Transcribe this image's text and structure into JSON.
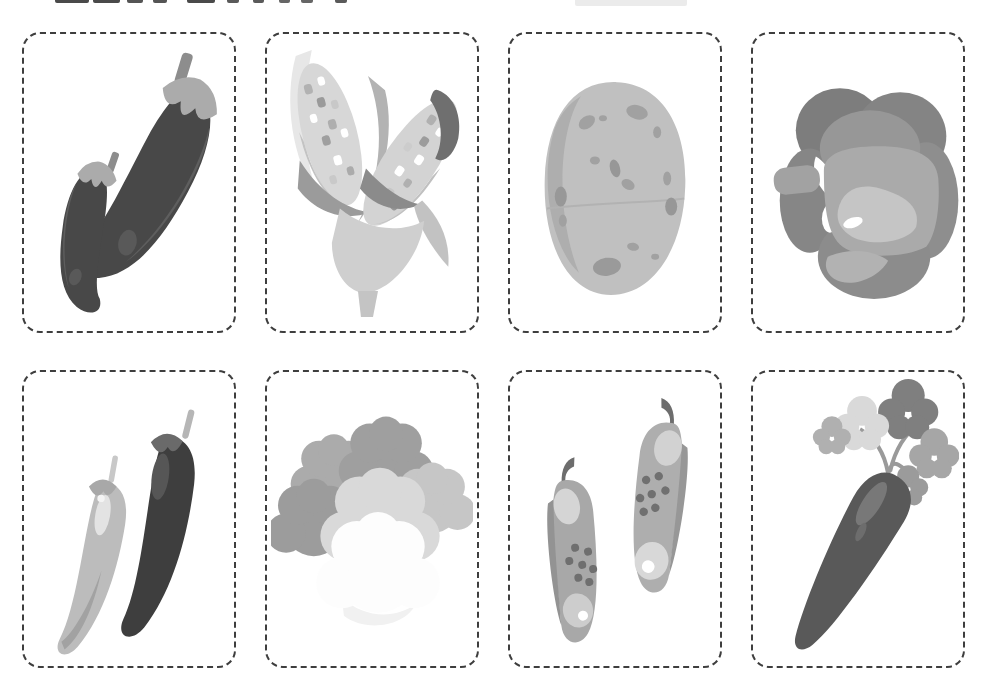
{
  "document": {
    "kind": "vegetable-flashcards-printable-sheet",
    "style": "grayscale",
    "background": "#ffffff",
    "rows": 2,
    "columns": 4
  },
  "header": {
    "note": "title cropped at top edge, only letter bottoms visible",
    "cropped_title_marks": [
      {
        "x": 55,
        "w": 34,
        "h": 3,
        "c": "#4a4a4a"
      },
      {
        "x": 93,
        "w": 27,
        "h": 3,
        "c": "#4a4a4a"
      },
      {
        "x": 127,
        "w": 16,
        "h": 3,
        "c": "#555555"
      },
      {
        "x": 153,
        "w": 14,
        "h": 3,
        "c": "#555555"
      },
      {
        "x": 187,
        "w": 28,
        "h": 3,
        "c": "#4a4a4a"
      },
      {
        "x": 227,
        "w": 12,
        "h": 3,
        "c": "#5a5a5a"
      },
      {
        "x": 253,
        "w": 11,
        "h": 3,
        "c": "#5a5a5a"
      },
      {
        "x": 279,
        "w": 11,
        "h": 3,
        "c": "#666666"
      },
      {
        "x": 301,
        "w": 12,
        "h": 3,
        "c": "#666666"
      },
      {
        "x": 335,
        "w": 12,
        "h": 3,
        "c": "#5a5a5a"
      },
      {
        "x": 575,
        "w": 112,
        "h": 6,
        "c": "#ebebeb"
      }
    ]
  },
  "palette": {
    "card_border": "#3e3e3e",
    "ink_darkest": "#3e3e3e",
    "ink_dark": "#4a4a4a",
    "ink_mid": "#8c8c8c",
    "ink_light": "#bfbfbf",
    "ink_faint": "#dcdcdc",
    "paper": "#ffffff"
  },
  "cards": [
    {
      "id": "eggplant",
      "name": "Eggplant",
      "count": 2,
      "icon": "eggplant-illustration"
    },
    {
      "id": "corn",
      "name": "Corn",
      "count": 2,
      "icon": "corn-illustration"
    },
    {
      "id": "potato",
      "name": "Potato",
      "count": 1,
      "icon": "potato-illustration"
    },
    {
      "id": "bell-pepper",
      "name": "Bell Pepper",
      "count": 1,
      "icon": "bell-pepper-illustration"
    },
    {
      "id": "chili-pepper",
      "name": "Chili Pepper",
      "count": 2,
      "icon": "chili-pepper-illustration"
    },
    {
      "id": "cauliflower",
      "name": "Cauliflower",
      "count": 1,
      "icon": "cauliflower-illustration"
    },
    {
      "id": "cucumber",
      "name": "Cucumber",
      "count": 2,
      "icon": "cucumber-illustration"
    },
    {
      "id": "carrot",
      "name": "Carrot",
      "count": 1,
      "icon": "carrot-illustration"
    }
  ]
}
